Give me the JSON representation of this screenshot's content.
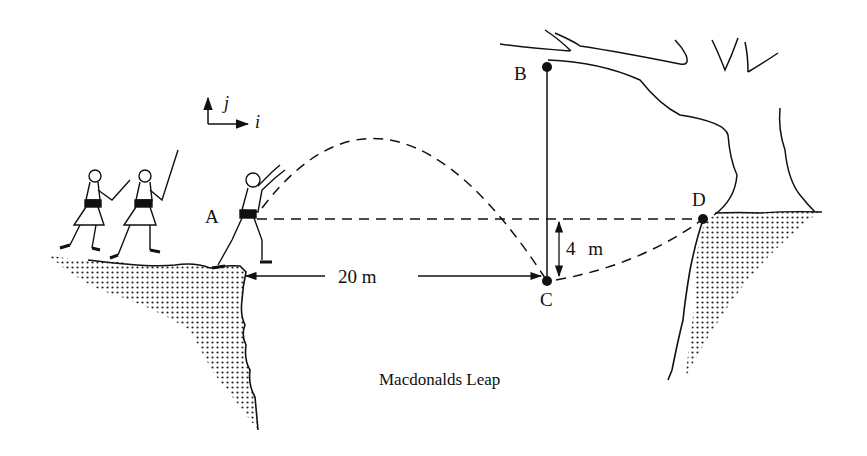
{
  "caption": "Macdonalds Leap",
  "axes": {
    "i_label": "i",
    "j_label": "j"
  },
  "points": {
    "A": "A",
    "B": "B",
    "C": "C",
    "D": "D"
  },
  "dimensions": {
    "horizontal": "20 m",
    "vertical": "4 m"
  },
  "colors": {
    "ink": "#111111",
    "background": "#ffffff"
  }
}
